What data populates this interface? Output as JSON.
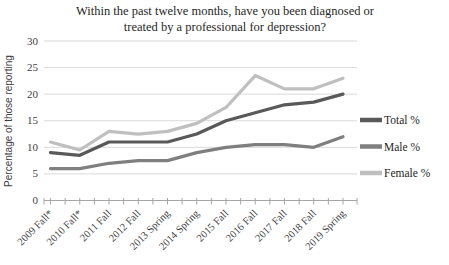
{
  "title": {
    "line1": "Within the past twelve months, have you been diagnosed or",
    "line2": "treated by a professional for depression?"
  },
  "chart_data": {
    "type": "line",
    "title": "Within the past twelve months, have you been diagnosed or treated by a professional for depression?",
    "xlabel": "",
    "ylabel": "Percentage of those reporting",
    "ylim": [
      0,
      30
    ],
    "yticks": [
      0,
      5,
      10,
      15,
      20,
      25,
      30
    ],
    "grid": true,
    "legend_position": "right",
    "categories": [
      "2009 Fall*",
      "2010 Fall*",
      "2011 Fall",
      "2012 Fall",
      "2013 Spring",
      "2014 Spring",
      "2015 Fall",
      "2016 Fall",
      "2017 Fall",
      "2018 Fall",
      "2019 Spring"
    ],
    "series": [
      {
        "name": "Total %",
        "color": "#595959",
        "values": [
          9,
          8.5,
          11,
          11,
          11,
          12.5,
          15,
          16.5,
          18,
          18.5,
          20
        ]
      },
      {
        "name": "Male %",
        "color": "#7f7f7f",
        "values": [
          6,
          6,
          7,
          7.5,
          7.5,
          9,
          10,
          10.5,
          10.5,
          10,
          12
        ]
      },
      {
        "name": "Female %",
        "color": "#bfbfbf",
        "values": [
          11,
          9.5,
          13,
          12.5,
          13,
          14.5,
          17.5,
          23.5,
          21,
          21,
          23
        ]
      }
    ]
  },
  "colors": {
    "gridline": "#d9d9d9",
    "axis_line": "#a6a6a6",
    "tick_mark": "#a6a6a6",
    "background": "#ffffff"
  }
}
